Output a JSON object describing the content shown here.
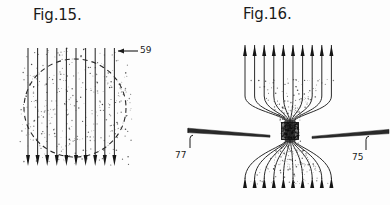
{
  "page": {
    "kind": "patent-figure-sheet",
    "background_color": "#fdfdfd",
    "ink_color": "#1b1b1b",
    "width": 390,
    "height": 205
  },
  "figures": [
    {
      "id": "fig-15",
      "title": "Fig.15.",
      "title_position": {
        "x": 33,
        "y": 6
      },
      "description": "uniform vertical magnetic field lines passing through a dashed circular boundary with stippled shading",
      "field_lines": {
        "count": 10,
        "direction": "down",
        "arrowhead_position": "bottom",
        "x_start": 28,
        "x_spacing": 9.6,
        "y_top": 48,
        "y_bottom": 166
      },
      "boundary": {
        "shape": "dashed-circle",
        "center_x": 75,
        "center_y": 108,
        "radius_x": 51,
        "radius_y": 49,
        "dash": "5 4"
      },
      "stipple": {
        "count": 520,
        "region": "circle-and-margins"
      },
      "callouts": [
        {
          "id": "callout-59",
          "label": "59",
          "label_position": {
            "x": 140,
            "y": 45
          },
          "leader": {
            "from_x": 138,
            "from_y": 51,
            "to_x": 116,
            "to_y": 51,
            "arrow_at": "to"
          },
          "points_to": "field-line"
        }
      ]
    },
    {
      "id": "fig-16",
      "title": "Fig.16.",
      "title_position": {
        "x": 243,
        "y": 5
      },
      "description": "magnetic field lines converging into a dense focal pinch between two tapered pole pieces, then diverging below",
      "field_lines": {
        "count": 10,
        "direction": "up",
        "arrowhead_position": "both-ends",
        "x_start": 245,
        "x_spacing": 9.6,
        "y_top": 45,
        "y_bottom": 188,
        "pinch_x": 290,
        "pinch_y": 131
      },
      "focal_core": {
        "shape": "dense-square",
        "center_x": 290,
        "center_y": 131,
        "size": 17
      },
      "stipple": {
        "count": 560,
        "region": "hourglass"
      },
      "pole_pieces": [
        {
          "id": "pole-piece-left",
          "label": "77",
          "label_position": {
            "x": 175,
            "y": 150
          },
          "side": "left",
          "tip_x": 270,
          "tip_y": 136,
          "back_x": 188,
          "back_y": 130,
          "leader": {
            "from_x": 190,
            "from_y": 148,
            "to_x": 190,
            "to_y": 136
          }
        },
        {
          "id": "pole-piece-right",
          "label": "75",
          "label_position": {
            "x": 352,
            "y": 152
          },
          "side": "right",
          "tip_x": 312,
          "tip_y": 137,
          "back_x": 388,
          "back_y": 131,
          "leader": {
            "from_x": 366,
            "from_y": 150,
            "to_x": 366,
            "to_y": 138
          }
        }
      ]
    }
  ]
}
